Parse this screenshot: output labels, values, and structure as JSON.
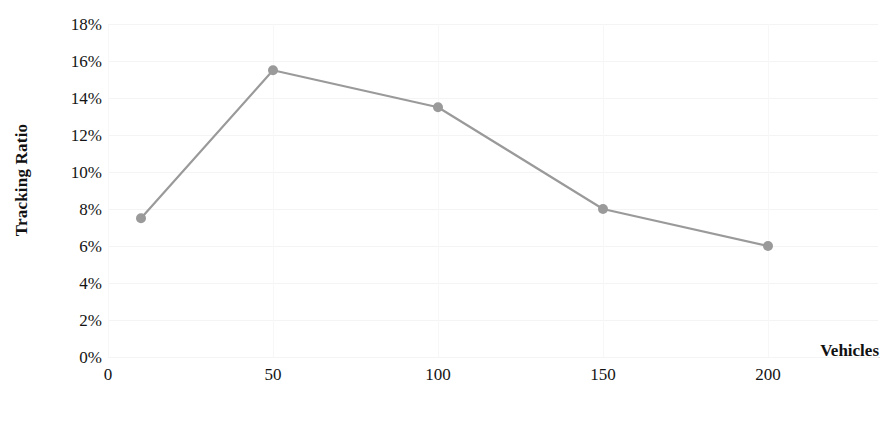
{
  "chart_data": {
    "type": "line",
    "title": "",
    "xlabel": "Vehicles",
    "ylabel": "Tracking Ratio",
    "x": [
      10,
      50,
      100,
      150,
      200
    ],
    "values": [
      7.5,
      15.5,
      13.5,
      8.0,
      6.0
    ],
    "series": [
      {
        "name": "Tracking Ratio",
        "values": [
          7.5,
          15.5,
          13.5,
          8.0,
          6.0
        ]
      }
    ],
    "xlim": [
      0,
      215
    ],
    "ylim": [
      0,
      18
    ],
    "x_tick_labels": [
      "0",
      "50",
      "100",
      "150",
      "200"
    ],
    "x_tick_values": [
      0,
      50,
      100,
      150,
      200
    ],
    "y_tick_labels": [
      "0%",
      "2%",
      "4%",
      "6%",
      "8%",
      "10%",
      "12%",
      "14%",
      "16%",
      "18%"
    ],
    "y_tick_values": [
      0,
      2,
      4,
      6,
      8,
      10,
      12,
      14,
      16,
      18
    ],
    "grid": true,
    "legend": false,
    "legend_position": "none",
    "line_color": "#9a9a9a",
    "marker_color": "#9a9a9a",
    "grid_color": "#f4f4f4",
    "axis_color": "#e2e2e2",
    "text_color": "#141414",
    "background": "#ffffff"
  }
}
